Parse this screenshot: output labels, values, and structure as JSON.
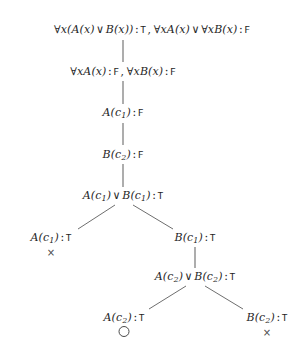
{
  "document": {
    "kind": "semantic-tableau-proof-tree",
    "background_color": "#ffffff",
    "ink_color": "#262626",
    "line_color": "#5d5d5d"
  },
  "tree": {
    "nodes": [
      {
        "id": "n1",
        "text": "∀x(A(x) ∨ B(x)) : T, ∀xA(x) ∨ ∀xB(x) : F",
        "formula_1": "∀x(A(x) ∨ B(x))",
        "value_1": "T",
        "formula_2": "∀xA(x) ∨ ∀xB(x)",
        "value_2": "F",
        "x": 152,
        "y": 30
      },
      {
        "id": "n2",
        "text": "∀xA(x) : F, ∀xB(x) : F",
        "formula_1": "∀xA(x)",
        "value_1": "F",
        "formula_2": "∀xB(x)",
        "value_2": "F",
        "x": 123,
        "y": 72
      },
      {
        "id": "n3",
        "text": "A(c₁) : F",
        "formula_1": "A(c₁)",
        "value_1": "F",
        "x": 123,
        "y": 113
      },
      {
        "id": "n4",
        "text": "B(c₂) : F",
        "formula_1": "B(c₂)",
        "value_1": "F",
        "x": 123,
        "y": 155
      },
      {
        "id": "n5",
        "text": "A(c₁) ∨ B(c₁) : T",
        "formula_1": "A(c₁) ∨ B(c₁)",
        "value_1": "T",
        "x": 123,
        "y": 196
      },
      {
        "id": "n6",
        "text": "A(c₁) : T",
        "formula_1": "A(c₁)",
        "value_1": "T",
        "x": 51,
        "y": 238
      },
      {
        "id": "n7",
        "text": "B(c₁) : T",
        "formula_1": "B(c₁)",
        "value_1": "T",
        "x": 195,
        "y": 238
      },
      {
        "id": "n8",
        "text": "A(c₂) ∨ B(c₂) : T",
        "formula_1": "A(c₂) ∨ B(c₂)",
        "value_1": "T",
        "x": 195,
        "y": 277
      },
      {
        "id": "n9",
        "text": "A(c₂) : T",
        "formula_1": "A(c₂)",
        "value_1": "T",
        "x": 124,
        "y": 318
      },
      {
        "id": "n10",
        "text": "B(c₂) : T",
        "formula_1": "B(c₂)",
        "value_1": "T",
        "x": 267,
        "y": 318
      }
    ],
    "markers": [
      {
        "id": "m6",
        "node": "n6",
        "symbol": "×",
        "meaning": "closed-branch",
        "x": 51,
        "y": 252
      },
      {
        "id": "m9",
        "node": "n9",
        "symbol": "○",
        "meaning": "open-branch",
        "x": 124,
        "y": 331
      },
      {
        "id": "m10",
        "node": "n10",
        "symbol": "×",
        "meaning": "closed-branch",
        "x": 267,
        "y": 332
      }
    ],
    "vertical_edges": [
      {
        "id": "e1",
        "from": "n1",
        "to": "n2",
        "x": 123,
        "y": 40,
        "height": 22
      },
      {
        "id": "e2",
        "from": "n2",
        "to": "n3",
        "x": 123,
        "y": 81,
        "height": 23
      },
      {
        "id": "e3",
        "from": "n3",
        "to": "n4",
        "x": 123,
        "y": 123,
        "height": 22
      },
      {
        "id": "e4",
        "from": "n4",
        "to": "n5",
        "x": 123,
        "y": 164,
        "height": 23
      },
      {
        "id": "e5",
        "from": "n7",
        "to": "n8",
        "x": 195,
        "y": 247,
        "height": 21
      }
    ],
    "diagonal_edges": [
      {
        "id": "d1",
        "from": "n5",
        "to": "n6",
        "x1": 115,
        "y1": 205,
        "x2": 78,
        "y2": 229
      },
      {
        "id": "d2",
        "from": "n5",
        "to": "n7",
        "x1": 133,
        "y1": 205,
        "x2": 173,
        "y2": 229
      },
      {
        "id": "d3",
        "from": "n8",
        "to": "n9",
        "x1": 186,
        "y1": 286,
        "x2": 149,
        "y2": 309
      },
      {
        "id": "d4",
        "from": "n8",
        "to": "n10",
        "x1": 205,
        "y1": 286,
        "x2": 243,
        "y2": 309
      }
    ]
  },
  "legend": {
    "closed_symbol": "×",
    "open_symbol": "○",
    "true_label": "T",
    "false_label": "F",
    "disjunction_symbol": "∨",
    "universal_symbol": "∀"
  }
}
